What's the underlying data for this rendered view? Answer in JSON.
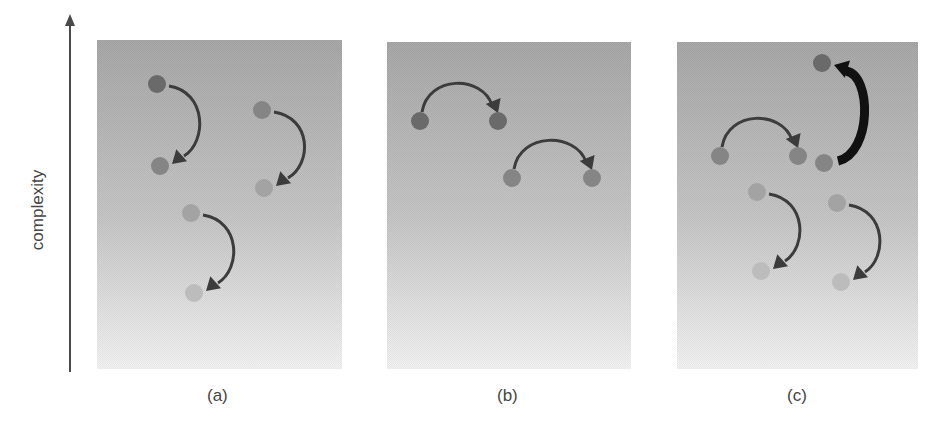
{
  "axis": {
    "label": "complexity",
    "direction": "up",
    "color": "#4a4a4a"
  },
  "colors": {
    "panel_top": "#a9a9a9",
    "panel_bottom": "#f4f4f4",
    "arrow": "#3c3c3c",
    "arrow_thick": "#111111",
    "dot_dark": "#6a6a6a",
    "dot_mid": "#858585",
    "dot_light": "#a3a3a3",
    "dot_faint": "#bcbcbc"
  },
  "panels": [
    {
      "label": "(a)",
      "x": 97,
      "y": 40,
      "w": 245,
      "h": 329,
      "transitions": [
        {
          "from": [
            157,
            84
          ],
          "to": [
            160,
            166
          ],
          "style": "vertical",
          "from_shade": "dot_dark",
          "to_shade": "dot_mid",
          "thick": false
        },
        {
          "from": [
            262,
            110
          ],
          "to": [
            264,
            188
          ],
          "style": "vertical",
          "from_shade": "dot_mid",
          "to_shade": "dot_light",
          "thick": false
        },
        {
          "from": [
            191,
            213
          ],
          "to": [
            194,
            293
          ],
          "style": "vertical",
          "from_shade": "dot_light",
          "to_shade": "dot_faint",
          "thick": false
        }
      ]
    },
    {
      "label": "(b)",
      "x": 387,
      "y": 42,
      "w": 244,
      "h": 327,
      "transitions": [
        {
          "from": [
            420,
            121
          ],
          "to": [
            498,
            121
          ],
          "style": "horizontal",
          "from_shade": "dot_dark",
          "to_shade": "dot_dark",
          "thick": false
        },
        {
          "from": [
            512,
            178
          ],
          "to": [
            592,
            178
          ],
          "style": "horizontal",
          "from_shade": "dot_mid",
          "to_shade": "dot_mid",
          "thick": false
        }
      ]
    },
    {
      "label": "(c)",
      "x": 677,
      "y": 42,
      "w": 241,
      "h": 327,
      "transitions": [
        {
          "from": [
            824,
            163
          ],
          "to": [
            822,
            63
          ],
          "style": "vertical-up",
          "from_shade": "dot_mid",
          "to_shade": "dot_dark",
          "thick": true
        },
        {
          "from": [
            720,
            156
          ],
          "to": [
            798,
            156
          ],
          "style": "horizontal",
          "from_shade": "dot_mid",
          "to_shade": "dot_mid",
          "thick": false
        },
        {
          "from": [
            757,
            192
          ],
          "to": [
            761,
            271
          ],
          "style": "vertical",
          "from_shade": "dot_light",
          "to_shade": "dot_faint",
          "thick": false
        },
        {
          "from": [
            837,
            203
          ],
          "to": [
            841,
            282
          ],
          "style": "vertical",
          "from_shade": "dot_light",
          "to_shade": "dot_faint",
          "thick": false
        }
      ]
    }
  ]
}
